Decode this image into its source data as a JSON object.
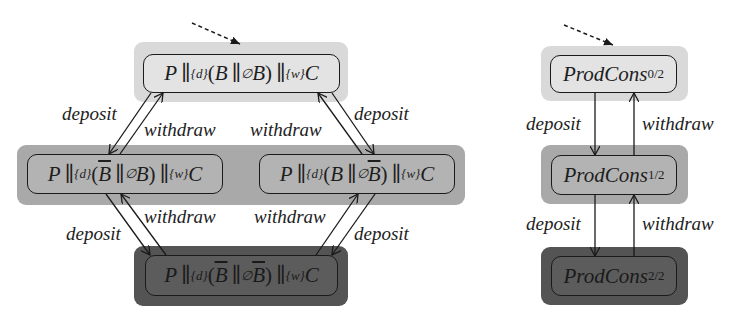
{
  "left_diagram": {
    "nodes": [
      {
        "id": "s00",
        "P": "P",
        "sync1": "{d}",
        "B1": "B",
        "B1_bar": false,
        "sync_mid": "∅",
        "B2": "B",
        "B2_bar": false,
        "sync2": "{w}",
        "C": "C",
        "shade": "light",
        "initial": true
      },
      {
        "id": "s10",
        "P": "P",
        "sync1": "{d}",
        "B1": "B",
        "B1_bar": true,
        "sync_mid": "∅",
        "B2": "B",
        "B2_bar": false,
        "sync2": "{w}",
        "C": "C",
        "shade": "mid"
      },
      {
        "id": "s01",
        "P": "P",
        "sync1": "{d}",
        "B1": "B",
        "B1_bar": false,
        "sync_mid": "∅",
        "B2": "B",
        "B2_bar": true,
        "sync2": "{w}",
        "C": "C",
        "shade": "mid"
      },
      {
        "id": "s11",
        "P": "P",
        "sync1": "{d}",
        "B1": "B",
        "B1_bar": true,
        "sync_mid": "∅",
        "B2": "B",
        "B2_bar": true,
        "sync2": "{w}",
        "C": "C",
        "shade": "dark"
      }
    ],
    "labels": {
      "top_left_deposit": "deposit",
      "top_left_withdraw": "withdraw",
      "top_right_withdraw": "withdraw",
      "top_right_deposit": "deposit",
      "bottom_left_withdraw": "withdraw",
      "bottom_left_deposit": "deposit",
      "bottom_right_withdraw": "withdraw",
      "bottom_right_deposit": "deposit"
    },
    "edges": [
      {
        "from": "s00",
        "to": "s10",
        "label": "deposit"
      },
      {
        "from": "s10",
        "to": "s00",
        "label": "withdraw"
      },
      {
        "from": "s00",
        "to": "s01",
        "label": "deposit"
      },
      {
        "from": "s01",
        "to": "s00",
        "label": "withdraw"
      },
      {
        "from": "s10",
        "to": "s11",
        "label": "deposit"
      },
      {
        "from": "s11",
        "to": "s10",
        "label": "withdraw"
      },
      {
        "from": "s01",
        "to": "s11",
        "label": "deposit"
      },
      {
        "from": "s11",
        "to": "s01",
        "label": "withdraw"
      }
    ]
  },
  "right_diagram": {
    "nodes": [
      {
        "id": "pc0",
        "name": "ProdCons",
        "sub": "0/2",
        "shade": "light",
        "initial": true
      },
      {
        "id": "pc1",
        "name": "ProdCons",
        "sub": "1/2",
        "shade": "mid"
      },
      {
        "id": "pc2",
        "name": "ProdCons",
        "sub": "2/2",
        "shade": "dark"
      }
    ],
    "labels": {
      "upper_deposit": "deposit",
      "upper_withdraw": "withdraw",
      "lower_deposit": "deposit",
      "lower_withdraw": "withdraw"
    },
    "edges": [
      {
        "from": "pc0",
        "to": "pc1",
        "label": "deposit"
      },
      {
        "from": "pc1",
        "to": "pc0",
        "label": "withdraw"
      },
      {
        "from": "pc1",
        "to": "pc2",
        "label": "deposit"
      },
      {
        "from": "pc2",
        "to": "pc1",
        "label": "withdraw"
      }
    ]
  },
  "symbols": {
    "par": "∥",
    "open": "(",
    "close": ")"
  },
  "colors": {
    "shade_light": "#d9d9d9",
    "shade_mid": "#a9a9a9",
    "shade_dark": "#545454",
    "node_light": "#e3e3e3",
    "node_mid": "#b3b3b3",
    "node_dark": "#5c5c5c",
    "stroke": "#1a1a1a"
  }
}
